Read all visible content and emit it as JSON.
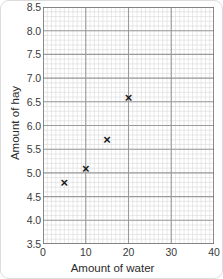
{
  "chart_data": {
    "type": "scatter",
    "title": "",
    "xlabel": "Amount of water",
    "ylabel": "Amount of hay",
    "xlim": [
      0,
      40
    ],
    "ylim": [
      3.5,
      8.5
    ],
    "x_ticks": [
      "0",
      "10",
      "20",
      "30",
      "40"
    ],
    "x_tick_values": [
      0,
      10,
      20,
      30,
      40
    ],
    "y_ticks": [
      "8.5",
      "8.0",
      "7.5",
      "7.0",
      "6.5",
      "6.0",
      "5.5",
      "5.0",
      "4.5",
      "4.0",
      "3.5"
    ],
    "y_tick_values": [
      8.5,
      8.0,
      7.5,
      7.0,
      6.5,
      6.0,
      5.5,
      5.0,
      4.5,
      4.0,
      3.5
    ],
    "x_minor_step": 1,
    "y_minor_step": 0.1,
    "grid": true,
    "legend": false,
    "marker": "x",
    "marker_color": "#1a1a1a",
    "grid_major_color": "#9a9a9a",
    "grid_minor_color": "#d8d8d8",
    "points": [
      {
        "x": 5,
        "y": 4.8
      },
      {
        "x": 10,
        "y": 5.1
      },
      {
        "x": 15,
        "y": 5.7
      },
      {
        "x": 20,
        "y": 6.6
      }
    ]
  }
}
